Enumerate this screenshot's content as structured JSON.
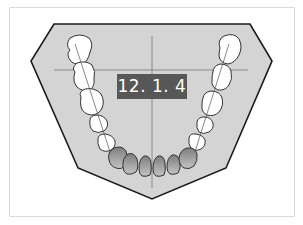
{
  "diagram": {
    "label": "12. 1. 4",
    "colors": {
      "arch_fill": "#d4d4d4",
      "arch_stroke": "#1a1a1a",
      "tooth_fill": "#ffffff",
      "incisor_fill": "#9a9a9a",
      "label_bg": "#575757",
      "label_text": "#ffffff",
      "guide_line": "#777777"
    }
  }
}
